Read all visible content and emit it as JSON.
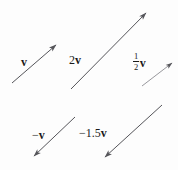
{
  "figure": {
    "background_color": "#fdfdfd",
    "stroke_color": "#55555a",
    "text_color": "#1a1a1a",
    "width": 178,
    "height": 170
  },
  "labels": {
    "v": "v",
    "two_v_scalar": "2",
    "two_v_vector": "v",
    "half_v_numerator": "1",
    "half_v_denominator": "2",
    "half_v_vector": "v",
    "neg_v_scalar": "−",
    "neg_v_vector": "v",
    "neg_1_5_v_scalar": "−1.5",
    "neg_1_5_v_vector": "v"
  },
  "vectors": [
    {
      "name": "v",
      "label": "v",
      "scalar": 1,
      "x1": 12,
      "y1": 83,
      "x2": 56,
      "y2": 45,
      "arrow_at": "end"
    },
    {
      "name": "2v",
      "label": "2v",
      "scalar": 2,
      "x1": 71,
      "y1": 89,
      "x2": 146,
      "y2": 13,
      "arrow_at": "end"
    },
    {
      "name": "half-v",
      "label": "1/2 v",
      "scalar": 0.5,
      "x1": 142,
      "y1": 86,
      "x2": 172,
      "y2": 63,
      "arrow_at": "end"
    },
    {
      "name": "neg-v",
      "label": "−v",
      "scalar": -1,
      "x1": 75,
      "y1": 117,
      "x2": 34,
      "y2": 156,
      "arrow_at": "end"
    },
    {
      "name": "neg-1.5v",
      "label": "−1.5v",
      "scalar": -1.5,
      "x1": 162,
      "y1": 105,
      "x2": 105,
      "y2": 157,
      "arrow_at": "end"
    }
  ]
}
